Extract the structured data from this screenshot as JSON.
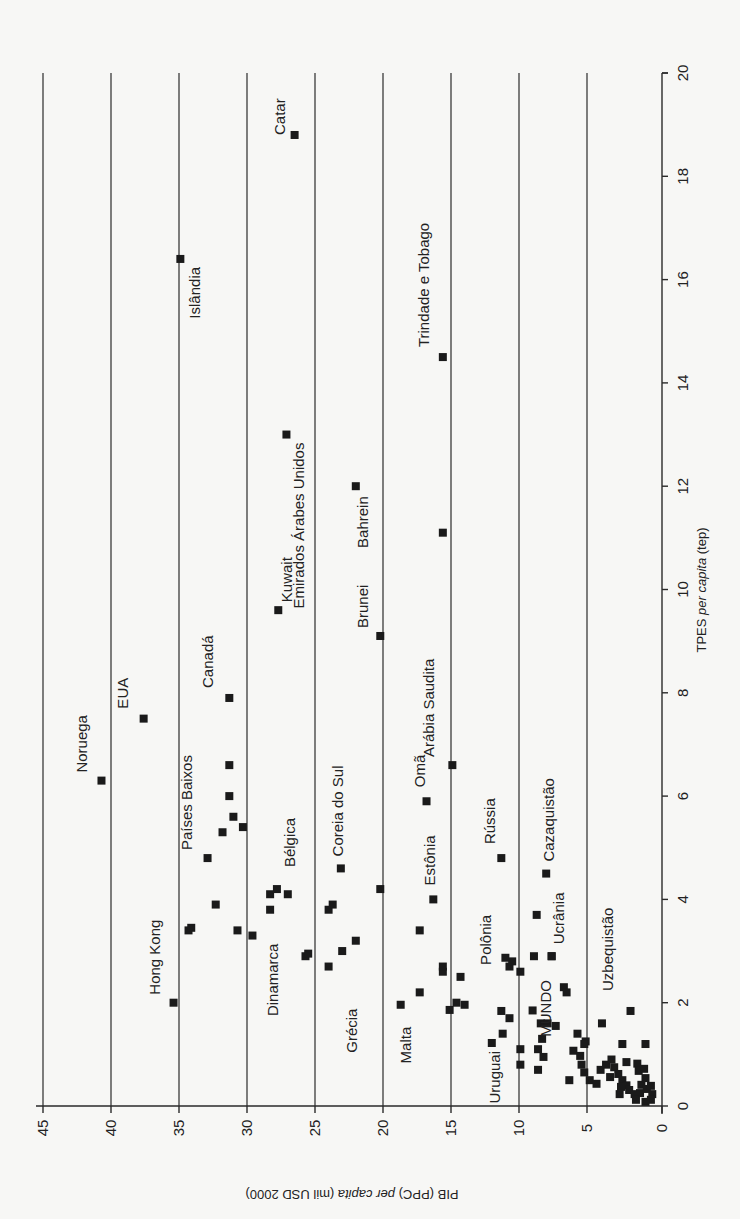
{
  "chart_data": {
    "type": "scatter",
    "orientation": "rotated-90-clockwise",
    "title": "",
    "xlabel": "TPES per capita (tep)",
    "xlabel_parts": [
      "TPES ",
      "per capita",
      " (tep)"
    ],
    "ylabel": "PIB (PPC) per capita (mil USD 2000)",
    "ylabel_parts": [
      "PIB (PPC) ",
      "per capita",
      " (mil USD 2000)"
    ],
    "xlim": [
      0,
      20
    ],
    "ylim": [
      0,
      45
    ],
    "x_ticks": [
      0,
      2,
      4,
      6,
      8,
      10,
      12,
      14,
      16,
      18,
      20
    ],
    "y_ticks": [
      0,
      5,
      10,
      15,
      20,
      25,
      30,
      35,
      40,
      45
    ],
    "grid": "horizontal lines at each y tick (GDP)",
    "legend": null,
    "labeled_points": [
      {
        "name": "Noruega",
        "x": 6.3,
        "y": 40.7
      },
      {
        "name": "EUA",
        "x": 7.5,
        "y": 37.6
      },
      {
        "name": "Hong Kong",
        "x": 2.0,
        "y": 35.4
      },
      {
        "name": "Países Baixos",
        "x": 4.8,
        "y": 32.9
      },
      {
        "name": "Islândia",
        "x": 16.4,
        "y": 34.9
      },
      {
        "name": "Canadá",
        "x": 7.9,
        "y": 31.3
      },
      {
        "name": "Dinamarca",
        "x": 3.3,
        "y": 29.6
      },
      {
        "name": "Bélgica",
        "x": 4.2,
        "y": 27.8
      },
      {
        "name": "Kuwait",
        "x": 9.6,
        "y": 27.7
      },
      {
        "name": "Emirados Árabes Unidos",
        "x": 13.0,
        "y": 27.1
      },
      {
        "name": "Catar",
        "x": 18.8,
        "y": 26.5
      },
      {
        "name": "Grécia",
        "x": 2.7,
        "y": 24.0
      },
      {
        "name": "Coreia do Sul",
        "x": 4.6,
        "y": 23.1
      },
      {
        "name": "Bahrein",
        "x": 12.0,
        "y": 22.0
      },
      {
        "name": "Brunei",
        "x": 9.1,
        "y": 20.2
      },
      {
        "name": "Malta",
        "x": 1.96,
        "y": 18.7
      },
      {
        "name": "Omã",
        "x": 5.9,
        "y": 16.8
      },
      {
        "name": "Estônia",
        "x": 4.0,
        "y": 16.3
      },
      {
        "name": "Trindade e Tobago",
        "x": 14.5,
        "y": 15.6
      },
      {
        "name": "Arábia Saudita",
        "x": 6.6,
        "y": 14.9
      },
      {
        "name": "Polônia",
        "x": 2.5,
        "y": 14.3
      },
      {
        "name": "Uruguai",
        "x": 1.22,
        "y": 12.0
      },
      {
        "name": "Rússia",
        "x": 4.8,
        "y": 11.3
      },
      {
        "name": "MUNDO",
        "x": 1.85,
        "y": 9.0
      },
      {
        "name": "Cazaquistão",
        "x": 4.5,
        "y": 8.0
      },
      {
        "name": "Ucrânia",
        "x": 2.9,
        "y": 7.6
      },
      {
        "name": "Uzbequistão",
        "x": 1.84,
        "y": 1.8
      }
    ],
    "unlabeled_points": [
      {
        "x": 6.6,
        "y": 31.3
      },
      {
        "x": 6.0,
        "y": 31.3
      },
      {
        "x": 5.6,
        "y": 31.0
      },
      {
        "x": 5.3,
        "y": 31.8
      },
      {
        "x": 5.4,
        "y": 30.3
      },
      {
        "x": 3.4,
        "y": 34.3
      },
      {
        "x": 3.45,
        "y": 34.1
      },
      {
        "x": 3.9,
        "y": 32.3
      },
      {
        "x": 3.4,
        "y": 30.7
      },
      {
        "x": 4.1,
        "y": 28.3
      },
      {
        "x": 3.8,
        "y": 28.3
      },
      {
        "x": 4.1,
        "y": 27.0
      },
      {
        "x": 2.9,
        "y": 25.7
      },
      {
        "x": 2.95,
        "y": 25.5
      },
      {
        "x": 3.8,
        "y": 24.0
      },
      {
        "x": 3.9,
        "y": 23.7
      },
      {
        "x": 3.0,
        "y": 23.0
      },
      {
        "x": 3.2,
        "y": 22.0
      },
      {
        "x": 4.2,
        "y": 20.2
      },
      {
        "x": 11.1,
        "y": 15.6
      },
      {
        "x": 3.4,
        "y": 17.3
      },
      {
        "x": 2.2,
        "y": 17.3
      },
      {
        "x": 2.6,
        "y": 15.6
      },
      {
        "x": 2.7,
        "y": 15.6
      },
      {
        "x": 1.86,
        "y": 15.1
      },
      {
        "x": 2.0,
        "y": 14.6
      },
      {
        "x": 1.96,
        "y": 14.0
      },
      {
        "x": 2.87,
        "y": 11.0
      },
      {
        "x": 2.7,
        "y": 10.7
      },
      {
        "x": 2.8,
        "y": 10.5
      },
      {
        "x": 1.84,
        "y": 11.3
      },
      {
        "x": 1.7,
        "y": 10.7
      },
      {
        "x": 1.4,
        "y": 11.2
      },
      {
        "x": 2.6,
        "y": 9.9
      },
      {
        "x": 3.7,
        "y": 8.7
      },
      {
        "x": 2.9,
        "y": 8.9
      },
      {
        "x": 2.9,
        "y": 7.6
      },
      {
        "x": 2.3,
        "y": 6.7
      },
      {
        "x": 2.2,
        "y": 6.5
      },
      {
        "x": 1.1,
        "y": 9.9
      },
      {
        "x": 0.8,
        "y": 9.9
      },
      {
        "x": 1.6,
        "y": 8.4
      },
      {
        "x": 1.6,
        "y": 7.9
      },
      {
        "x": 1.55,
        "y": 7.3
      },
      {
        "x": 1.3,
        "y": 8.3
      },
      {
        "x": 1.1,
        "y": 8.6
      },
      {
        "x": 0.95,
        "y": 8.2
      },
      {
        "x": 0.7,
        "y": 8.6
      },
      {
        "x": 1.4,
        "y": 5.7
      },
      {
        "x": 1.25,
        "y": 5.1
      },
      {
        "x": 1.2,
        "y": 5.2
      },
      {
        "x": 1.07,
        "y": 6.0
      },
      {
        "x": 0.97,
        "y": 5.5
      },
      {
        "x": 0.8,
        "y": 5.4
      },
      {
        "x": 0.65,
        "y": 5.2
      },
      {
        "x": 0.5,
        "y": 6.3
      },
      {
        "x": 0.5,
        "y": 4.8
      },
      {
        "x": 0.43,
        "y": 4.3
      },
      {
        "x": 1.6,
        "y": 3.9
      },
      {
        "x": 1.2,
        "y": 2.4
      },
      {
        "x": 1.2,
        "y": 0.7
      },
      {
        "x": 0.7,
        "y": 4.0
      },
      {
        "x": 0.8,
        "y": 3.6
      },
      {
        "x": 0.9,
        "y": 3.2
      },
      {
        "x": 0.75,
        "y": 3.0
      },
      {
        "x": 0.56,
        "y": 3.3
      },
      {
        "x": 0.62,
        "y": 2.7
      },
      {
        "x": 0.5,
        "y": 2.4
      },
      {
        "x": 0.4,
        "y": 2.1
      },
      {
        "x": 0.37,
        "y": 2.5
      },
      {
        "x": 0.23,
        "y": 2.6
      },
      {
        "x": 0.85,
        "y": 2.1
      },
      {
        "x": 0.82,
        "y": 1.3
      },
      {
        "x": 0.68,
        "y": 1.2
      },
      {
        "x": 0.72,
        "y": 0.8
      },
      {
        "x": 0.54,
        "y": 0.7
      },
      {
        "x": 0.41,
        "y": 1.0
      },
      {
        "x": 0.31,
        "y": 1.9
      },
      {
        "x": 0.23,
        "y": 1.5
      },
      {
        "x": 0.25,
        "y": 1.1
      },
      {
        "x": 0.33,
        "y": 0.6
      },
      {
        "x": 0.39,
        "y": 0.3
      },
      {
        "x": 0.23,
        "y": 0.2
      },
      {
        "x": 0.12,
        "y": 1.4
      },
      {
        "x": 0.12,
        "y": 0.3
      },
      {
        "x": 0.08,
        "y": 0.7
      }
    ]
  }
}
